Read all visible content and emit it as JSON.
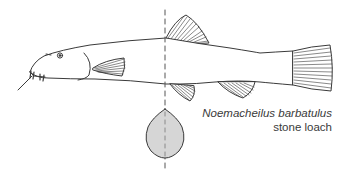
{
  "figure": {
    "scientific_name": "Noemacheilus barbatulus",
    "common_name": "stone loach",
    "elements": [
      "body-outline",
      "dorsal-fin",
      "pectoral-fin",
      "pelvic-fin",
      "anal-fin",
      "caudal-fin",
      "barbels",
      "eye",
      "section-line",
      "cross-section"
    ],
    "colors": {
      "line": "#3a3a3a",
      "cross_section_fill": "#d6d6d6",
      "background": "#ffffff"
    }
  }
}
